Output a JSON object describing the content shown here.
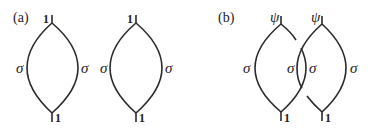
{
  "panels": [
    {
      "label": "(a)",
      "loops": [
        {
          "top_label": "1",
          "left_label": "σ",
          "right_label": "σ",
          "bottom_label": "1"
        },
        {
          "top_label": "1",
          "left_label": "σ",
          "right_label": "σ",
          "bottom_label": "1"
        }
      ]
    },
    {
      "label": "(b)",
      "loops": [
        {
          "top_label": "ψ",
          "left_label": "σ",
          "right_label": "σ",
          "bottom_label": "1"
        },
        {
          "top_label": "ψ",
          "left_label": "σ",
          "right_label": "σ",
          "bottom_label": "1"
        }
      ],
      "crossing": "braided"
    }
  ],
  "colors": {
    "stroke": "#2a2a2a",
    "background": "#ffffff"
  }
}
